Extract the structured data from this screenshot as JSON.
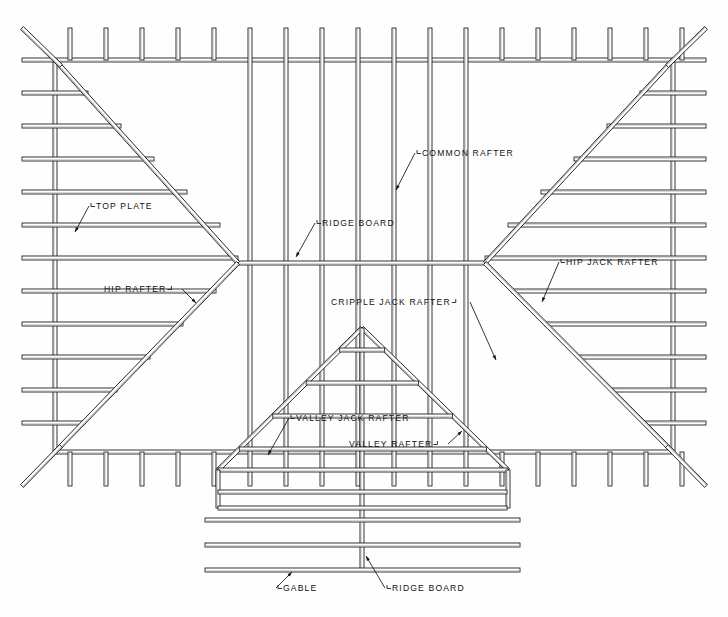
{
  "diagram": {
    "type": "architectural-framing-diagram",
    "background_color": "#fefefe",
    "line_color": "#111111",
    "board_fill": "#ffffff",
    "board_shade": "#9a9a9a"
  },
  "labels": {
    "top_plate": "TOP PLATE",
    "hip_rafter": "HIP RAFTER",
    "common_rafter": "COMMON RAFTER",
    "ridge_board_top": "RIDGE BOARD",
    "hip_jack_rafter": "HIP JACK RAFTER",
    "cripple_jack_rafter": "CRIPPLE JACK RAFTER",
    "valley_jack_rafter": "VALLEY JACK RAFTER",
    "valley_rafter": "VALLEY RAFTER",
    "gable": "GABLE",
    "ridge_board_bottom": "RIDGE BOARD"
  },
  "callouts": [
    {
      "name": "top-plate",
      "text": "TOP PLATE",
      "x": 96,
      "y": 209,
      "anchor": "start",
      "tick": "left",
      "leader": [
        [
          89,
          206
        ],
        [
          75,
          232
        ]
      ]
    },
    {
      "name": "hip-rafter",
      "text": "HIP RAFTER",
      "x": 104,
      "y": 292,
      "anchor": "start",
      "tick": "right",
      "leader": [
        [
          182,
          289
        ],
        [
          196,
          303
        ]
      ]
    },
    {
      "name": "common-rafter",
      "text": "COMMON RAFTER",
      "x": 422,
      "y": 156,
      "anchor": "start",
      "tick": "left",
      "leader": [
        [
          415,
          153
        ],
        [
          396,
          190
        ]
      ]
    },
    {
      "name": "ridge-board-top",
      "text": "RIDGE BOARD",
      "x": 322,
      "y": 226,
      "anchor": "start",
      "tick": "left",
      "leader": [
        [
          315,
          223
        ],
        [
          296,
          257
        ]
      ]
    },
    {
      "name": "hip-jack-rafter",
      "text": "HIP JACK RAFTER",
      "x": 566,
      "y": 265,
      "anchor": "start",
      "tick": "left",
      "leader": [
        [
          559,
          262
        ],
        [
          542,
          302
        ]
      ]
    },
    {
      "name": "cripple-jack-rafter",
      "text": "CRIPPLE JACK RAFTER",
      "x": 331,
      "y": 305,
      "anchor": "start",
      "tick": "right",
      "leader": [
        [
          470,
          302
        ],
        [
          496,
          360
        ]
      ]
    },
    {
      "name": "valley-jack-rafter",
      "text": "VALLEY JACK RAFTER",
      "x": 296,
      "y": 421,
      "anchor": "start",
      "tick": "left",
      "leader": [
        [
          289,
          418
        ],
        [
          268,
          455
        ]
      ]
    },
    {
      "name": "valley-rafter",
      "text": "VALLEY RAFTER",
      "x": 349,
      "y": 447,
      "anchor": "start",
      "tick": "right",
      "leader": [
        [
          448,
          444
        ],
        [
          462,
          431
        ]
      ]
    },
    {
      "name": "gable",
      "text": "GABLE",
      "x": 283,
      "y": 591,
      "anchor": "start",
      "tick": "left",
      "leader": [
        [
          276,
          588
        ],
        [
          292,
          572
        ]
      ]
    },
    {
      "name": "ridge-board-bottom",
      "text": "RIDGE BOARD",
      "x": 392,
      "y": 591,
      "anchor": "start",
      "tick": "left",
      "leader": [
        [
          385,
          588
        ],
        [
          366,
          556
        ]
      ]
    }
  ],
  "geometry": {
    "plan_left": 22,
    "plan_right": 706,
    "plan_top": 28,
    "plan_bottom": 486,
    "plate_left": 55,
    "plate_right": 673,
    "plate_top": 60,
    "plate_bottom": 452,
    "ridge_y": 263,
    "hip_apex_left_x": 238,
    "hip_apex_right_x": 485,
    "common_rafter_count": 19,
    "common_rafter_spacing": 36,
    "jack_rafter_spacing": 33,
    "dormer_apex_x": 362,
    "dormer_apex_y": 328,
    "dormer_left_x": 218,
    "dormer_right_x": 508,
    "dormer_base_y": 470,
    "gable_lines_y": [
      492,
      508,
      520,
      545,
      570
    ],
    "gable_left_x": 205,
    "gable_right_x": 520
  }
}
